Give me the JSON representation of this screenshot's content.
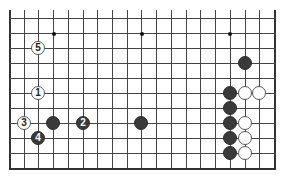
{
  "board": {
    "columns": 19,
    "rows_visible": 11,
    "origin_x": 9,
    "origin_y": 18,
    "spacing_x": 14.72,
    "spacing_y": 15,
    "left_edge": true,
    "right_edge": true,
    "bottom_edge": true,
    "top_edge": false,
    "line_color": "#444444",
    "background": "#ffffff"
  },
  "star_points": [
    {
      "col": 3,
      "row": 1
    },
    {
      "col": 9,
      "row": 1
    },
    {
      "col": 15,
      "row": 1
    }
  ],
  "stones": [
    {
      "color": "white",
      "col": 2,
      "row": 2,
      "label": "5"
    },
    {
      "color": "white",
      "col": 2,
      "row": 5,
      "label": "1"
    },
    {
      "color": "white",
      "col": 1,
      "row": 7,
      "label": "3"
    },
    {
      "color": "black",
      "col": 3,
      "row": 7,
      "label": ""
    },
    {
      "color": "black",
      "col": 5,
      "row": 7,
      "label": "2"
    },
    {
      "color": "black",
      "col": 2,
      "row": 8,
      "label": "4"
    },
    {
      "color": "black",
      "col": 9,
      "row": 7,
      "label": ""
    },
    {
      "color": "black",
      "col": 16,
      "row": 3,
      "label": ""
    },
    {
      "color": "black",
      "col": 15,
      "row": 5,
      "label": ""
    },
    {
      "color": "white",
      "col": 16,
      "row": 5,
      "label": ""
    },
    {
      "color": "white",
      "col": 17,
      "row": 5,
      "label": ""
    },
    {
      "color": "black",
      "col": 15,
      "row": 6,
      "label": ""
    },
    {
      "color": "black",
      "col": 15,
      "row": 7,
      "label": ""
    },
    {
      "color": "white",
      "col": 16,
      "row": 7,
      "label": ""
    },
    {
      "color": "black",
      "col": 15,
      "row": 8,
      "label": ""
    },
    {
      "color": "white",
      "col": 16,
      "row": 8,
      "label": ""
    },
    {
      "color": "black",
      "col": 15,
      "row": 9,
      "label": ""
    },
    {
      "color": "white",
      "col": 16,
      "row": 9,
      "label": ""
    }
  ]
}
